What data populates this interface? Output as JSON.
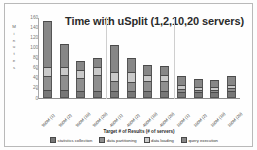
{
  "chart_data": {
    "type": "bar",
    "stacked": true,
    "title": "Time with uSplit (1,2,10,20 servers)",
    "xlabel": "Target # of Results (# of servers)",
    "ylabel": "Minutes",
    "ylim": [
      0,
      160
    ],
    "yticks": [
      0,
      20,
      40,
      60,
      80,
      100,
      120,
      140,
      160
    ],
    "grid": false,
    "legend_position": "bottom",
    "categories": [
      "900M (1)",
      "900M (2)",
      "900M (10)",
      "900M (20)",
      "400M (1)",
      "400M (2)",
      "400M (10)",
      "400M (20)",
      "100M (1)",
      "100M (2)",
      "100M (10)",
      "100M (20)"
    ],
    "series": [
      {
        "name": "statistics collection",
        "color": "#777777",
        "values": [
          15,
          15,
          13,
          14,
          14,
          13,
          13,
          13,
          12,
          11,
          11,
          14
        ]
      },
      {
        "name": "data partitioning",
        "color": "#8f8f8f",
        "values": [
          28,
          31,
          27,
          32,
          19,
          19,
          20,
          20,
          5,
          5,
          5,
          6
        ]
      },
      {
        "name": "data loading",
        "color": "#c9c9c9",
        "values": [
          19,
          16,
          16,
          16,
          18,
          19,
          13,
          12,
          8,
          6,
          6,
          6
        ]
      },
      {
        "name": "query execution",
        "color": "#878787",
        "values": [
          91,
          44,
          18,
          18,
          53,
          28,
          19,
          18,
          18,
          15,
          13,
          17
        ]
      }
    ],
    "totals": [
      153,
      106,
      74,
      80,
      104,
      79,
      65,
      63,
      43,
      37,
      35,
      43
    ],
    "group_separators_after": [
      4,
      8
    ]
  },
  "legend": {
    "items": [
      {
        "label": "statistics collection",
        "color": "#777777"
      },
      {
        "label": "data partitioning",
        "color": "#8f8f8f"
      },
      {
        "label": "data loading",
        "color": "#c9c9c9"
      },
      {
        "label": "query execution",
        "color": "#878787"
      }
    ]
  }
}
